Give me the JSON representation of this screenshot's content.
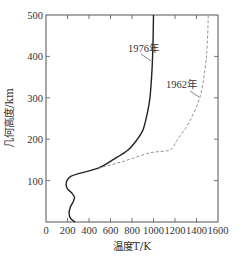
{
  "chart_data": {
    "type": "line",
    "title": "",
    "xlabel": "温度T/K",
    "ylabel": "几何高度/km",
    "xlim": [
      0,
      1600
    ],
    "ylim": [
      0,
      500
    ],
    "xticks": [
      0,
      200,
      400,
      600,
      800,
      1000,
      1200,
      1400,
      1600
    ],
    "yticks": [
      100,
      200,
      300,
      400,
      500
    ],
    "grid": false,
    "legend": "inline-labels",
    "series": [
      {
        "name": "1976年",
        "style": "solid",
        "color": "#222222",
        "points": [
          [
            270,
            0
          ],
          [
            230,
            8
          ],
          [
            215,
            20
          ],
          [
            225,
            35
          ],
          [
            255,
            50
          ],
          [
            265,
            60
          ],
          [
            240,
            70
          ],
          [
            200,
            80
          ],
          [
            187,
            90
          ],
          [
            195,
            100
          ],
          [
            230,
            110
          ],
          [
            320,
            118
          ],
          [
            484,
            130
          ],
          [
            620,
            150
          ],
          [
            763,
            174
          ],
          [
            850,
            200
          ],
          [
            902,
            222
          ],
          [
            940,
            260
          ],
          [
            967,
            300
          ],
          [
            986,
            367
          ],
          [
            995,
            430
          ],
          [
            1000,
            500
          ]
        ]
      },
      {
        "name": "1962年",
        "style": "dashed",
        "color": "#888888",
        "points": [
          [
            484,
            130
          ],
          [
            700,
            145
          ],
          [
            967,
            167
          ],
          [
            1153,
            174
          ],
          [
            1220,
            198
          ],
          [
            1330,
            240
          ],
          [
            1430,
            300
          ],
          [
            1480,
            370
          ],
          [
            1500,
            430
          ],
          [
            1510,
            500
          ]
        ]
      }
    ],
    "annotations": [
      {
        "text": "1976年",
        "series": "1976年",
        "anchor": [
          985,
          390
        ]
      },
      {
        "text": "1962年",
        "series": "1962年",
        "anchor": [
          1420,
          300
        ]
      }
    ]
  }
}
